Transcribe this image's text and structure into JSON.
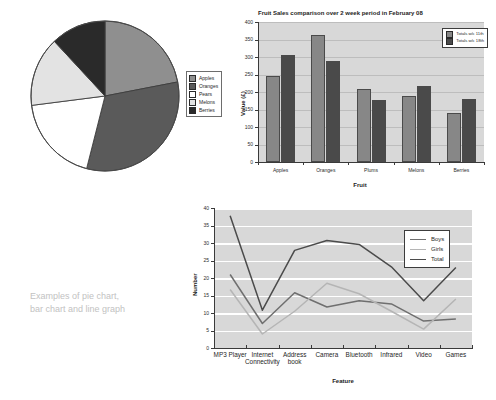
{
  "caption": {
    "line1": "Examples of pie chart,",
    "line2": "bar chart and line graph"
  },
  "colors": {
    "plot_background": "#d8d8d8",
    "gridline": "#ffffff",
    "axis": "#3a3a3a",
    "pie_apples": "#8f8f8f",
    "pie_oranges": "#5a5a5a",
    "pie_pears": "#ffffff",
    "pie_melons": "#e3e3e3",
    "pie_berries": "#2a2a2a",
    "bar_series1": "#878787",
    "bar_series2": "#4a4a4a",
    "line_boys": "#6f6f6f",
    "line_girls": "#b5b5b5",
    "line_total": "#4b4b4b",
    "caption_text": "#c2c2c2"
  },
  "chart_data": [
    {
      "id": "pie",
      "type": "pie",
      "title": "",
      "legend_position": "right",
      "categories": [
        "Apples",
        "Oranges",
        "Pears",
        "Melons",
        "Berries"
      ],
      "values": [
        22,
        32,
        19,
        15,
        12
      ],
      "slice_colors": [
        "#8f8f8f",
        "#5a5a5a",
        "#ffffff",
        "#e3e3e3",
        "#2a2a2a"
      ],
      "legend": [
        "Apples",
        "Oranges",
        "Pears",
        "Melons",
        "Berries"
      ]
    },
    {
      "id": "bar",
      "type": "bar",
      "title": "Fruit Sales comparison over 2 week period in February 08",
      "xlabel": "Fruit",
      "ylabel": "Value (£)",
      "ylim": [
        0,
        400
      ],
      "yticks": [
        0,
        50,
        100,
        150,
        200,
        250,
        300,
        350,
        400
      ],
      "grid": true,
      "legend_position": "top-right",
      "categories": [
        "Apples",
        "Oranges",
        "Plums",
        "Melons",
        "Berries"
      ],
      "series": [
        {
          "name": "Totals w/c 11th",
          "color": "#878787",
          "values": [
            245,
            363,
            210,
            188,
            141
          ]
        },
        {
          "name": "Totals w/c 18th",
          "color": "#4a4a4a",
          "values": [
            305,
            290,
            176,
            217,
            180
          ]
        }
      ]
    },
    {
      "id": "line",
      "type": "line",
      "title": "",
      "xlabel": "Feature",
      "ylabel": "Number",
      "ylim": [
        0,
        40
      ],
      "yticks": [
        0,
        5,
        10,
        15,
        20,
        25,
        30,
        35,
        40
      ],
      "grid": true,
      "legend_position": "top-right",
      "categories": [
        "MP3 Player",
        "Internet Connectivity",
        "Address book",
        "Camera",
        "Bluetooth",
        "Infrared",
        "Video",
        "Games"
      ],
      "category_lines": [
        [
          "MP3 Player",
          ""
        ],
        [
          "Internet",
          "Connectivity"
        ],
        [
          "Address",
          "book"
        ],
        [
          "Camera",
          ""
        ],
        [
          "Bluetooth",
          ""
        ],
        [
          "Infrared",
          ""
        ],
        [
          "Video",
          ""
        ],
        [
          "Games",
          ""
        ]
      ],
      "series": [
        {
          "name": "Boys",
          "color": "#6f6f6f",
          "values": [
            21,
            7,
            15.8,
            11.7,
            13.5,
            12.6,
            7.7,
            8.3
          ]
        },
        {
          "name": "Girls",
          "color": "#b5b5b5",
          "values": [
            16.7,
            4,
            10.5,
            18.5,
            15.5,
            10.5,
            5.4,
            14
          ]
        },
        {
          "name": "Total",
          "color": "#4b4b4b",
          "values": [
            37.8,
            10.8,
            27.9,
            30.7,
            29.6,
            23.2,
            13.5,
            23
          ]
        }
      ],
      "legend": [
        "Boys",
        "Girls",
        "Total"
      ]
    }
  ]
}
